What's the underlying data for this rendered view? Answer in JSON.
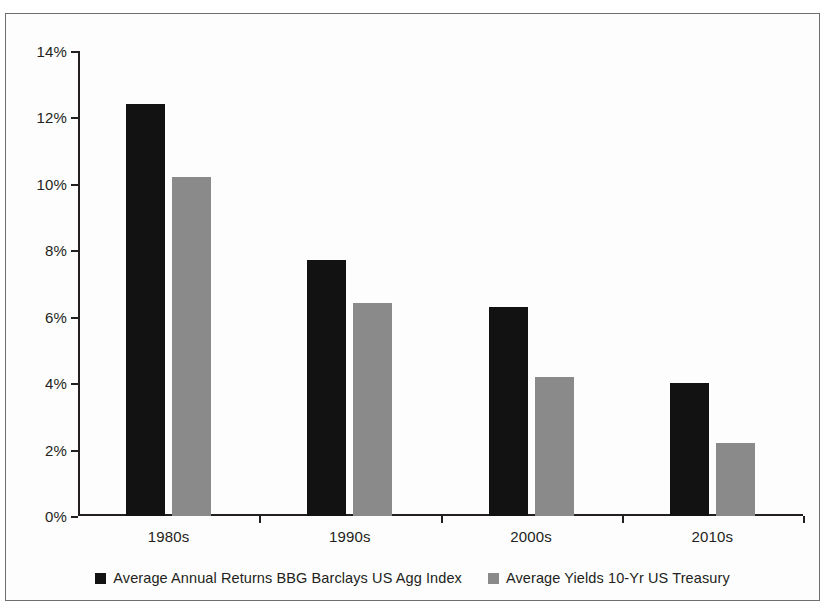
{
  "chart_data": {
    "type": "bar",
    "title": "",
    "xlabel": "",
    "ylabel": "",
    "categories": [
      "1980s",
      "1990s",
      "2000s",
      "2010s"
    ],
    "series": [
      {
        "name": "Average Annual Returns BBG Barclays US Agg Index",
        "color": "#121212",
        "values": [
          12.4,
          7.7,
          6.3,
          4.0
        ]
      },
      {
        "name": "Average Yields 10-Yr US Treasury",
        "color": "#8a8a8a",
        "values": [
          10.2,
          6.4,
          4.2,
          2.2
        ]
      }
    ],
    "ylim": [
      0,
      14
    ],
    "ytick_values": [
      0,
      2,
      4,
      6,
      8,
      10,
      12,
      14
    ],
    "ytick_labels": [
      "0%",
      "2%",
      "4%",
      "6%",
      "8%",
      "10%",
      "12%",
      "14%"
    ],
    "grid": false,
    "legend_position": "bottom",
    "value_suffix": "%"
  },
  "frame": {
    "border_color": "#6e6e6e",
    "background": "#fdfdfd"
  }
}
